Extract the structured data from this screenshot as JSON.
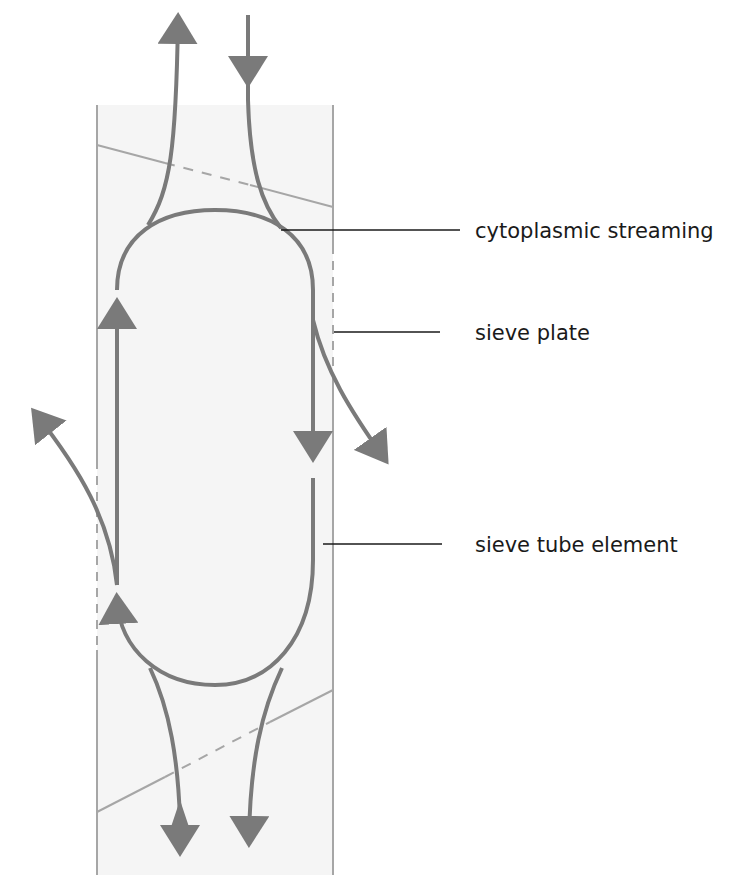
{
  "figure": {
    "cut_off_caption": "",
    "labels": {
      "cytoplasmic_streaming": "cytoplasmic streaming",
      "sieve_plate": "sieve plate",
      "sieve_tube_element": "sieve tube element"
    },
    "colors": {
      "tube_fill": "#f5f5f5",
      "wall": "#a6a6a6",
      "flow": "#7a7a7a",
      "label_line": "#1a1a1a",
      "text": "#1a1a1a"
    }
  }
}
